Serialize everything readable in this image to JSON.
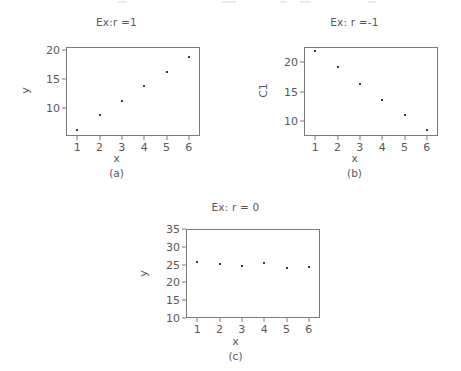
{
  "page": {
    "background": "#ffffff",
    "ink": "#585858",
    "marker_color": "#3a3a3a",
    "axis_color": "#7a7a7a"
  },
  "figures": [
    {
      "id": "a",
      "caption": "(a)",
      "title": "Ex:r =1",
      "ylabel": "y",
      "xlabel": "x",
      "chart_data": {
        "type": "scatter",
        "title": "Ex:r =1",
        "xlabel": "x",
        "ylabel": "y",
        "x": [
          1,
          2,
          3,
          4,
          5,
          6
        ],
        "values": [
          6.2,
          8.9,
          11.3,
          13.8,
          16.2,
          18.8
        ],
        "xticks": [
          "1",
          "2",
          "3",
          "4",
          "5",
          "6"
        ],
        "yticks": [
          "10",
          "15",
          "20"
        ],
        "ytick_values": [
          10,
          15,
          20
        ],
        "xlim": [
          0.5,
          6.5
        ],
        "ylim": [
          5.2,
          20.6
        ],
        "grid": false,
        "legend": false
      }
    },
    {
      "id": "b",
      "caption": "(b)",
      "title": "Ex: r =-1",
      "ylabel": "C1",
      "xlabel": "x",
      "chart_data": {
        "type": "scatter",
        "title": "Ex: r =-1",
        "xlabel": "x",
        "ylabel": "C1",
        "x": [
          1,
          2,
          3,
          4,
          5,
          6
        ],
        "values": [
          21.9,
          19.2,
          16.2,
          13.6,
          11.0,
          8.4
        ],
        "xticks": [
          "1",
          "2",
          "3",
          "4",
          "5",
          "6"
        ],
        "yticks": [
          "10",
          "15",
          "20"
        ],
        "ytick_values": [
          10,
          15,
          20
        ],
        "xlim": [
          0.5,
          6.5
        ],
        "ylim": [
          7.4,
          22.6
        ],
        "grid": false,
        "legend": false
      }
    },
    {
      "id": "c",
      "caption": "(c)",
      "title": "Ex: r = 0",
      "ylabel": "y",
      "xlabel": "x",
      "chart_data": {
        "type": "scatter",
        "title": "Ex: r = 0",
        "xlabel": "x",
        "ylabel": "y",
        "x": [
          1,
          2,
          3,
          4,
          5,
          6
        ],
        "values": [
          25.7,
          25.2,
          24.5,
          25.5,
          24.0,
          24.3
        ],
        "xticks": [
          "1",
          "2",
          "3",
          "4",
          "5",
          "6"
        ],
        "yticks": [
          "10",
          "15",
          "20",
          "25",
          "30",
          "35"
        ],
        "ytick_values": [
          10,
          15,
          20,
          25,
          30,
          35
        ],
        "xlim": [
          0.5,
          6.5
        ],
        "ylim": [
          10,
          35
        ],
        "grid": false,
        "legend": false
      }
    }
  ]
}
